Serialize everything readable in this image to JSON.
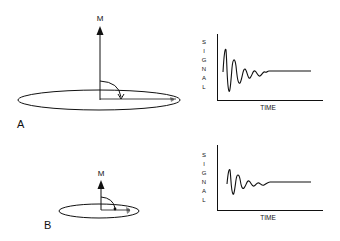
{
  "panels": [
    {
      "label": "A",
      "vector_label": "M",
      "chart": {
        "ylabel_letters": [
          "S",
          "I",
          "G",
          "N",
          "A",
          "L"
        ],
        "xlabel": "TIME"
      }
    },
    {
      "label": "B",
      "vector_label": "M",
      "chart": {
        "ylabel_letters": [
          "S",
          "I",
          "G",
          "N",
          "A",
          "L"
        ],
        "xlabel": "TIME"
      }
    }
  ],
  "colors": {
    "stroke": "#111111",
    "background": "#ffffff",
    "shade": "#888888"
  }
}
